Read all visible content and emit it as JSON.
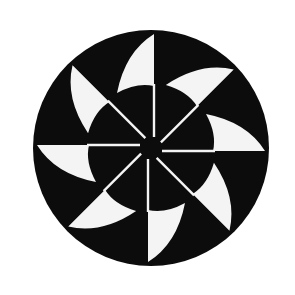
{
  "figure": {
    "label": "Pinwheel emblem",
    "background_color": "#ffffff",
    "disc_color": "#0c0c0c",
    "blade_color": "#f4f4f4",
    "center": [
      151,
      148
    ],
    "disc_radius": 118,
    "blade_count": 8,
    "blade_rotation_step_deg": 45,
    "start_angle_deg": 0
  }
}
